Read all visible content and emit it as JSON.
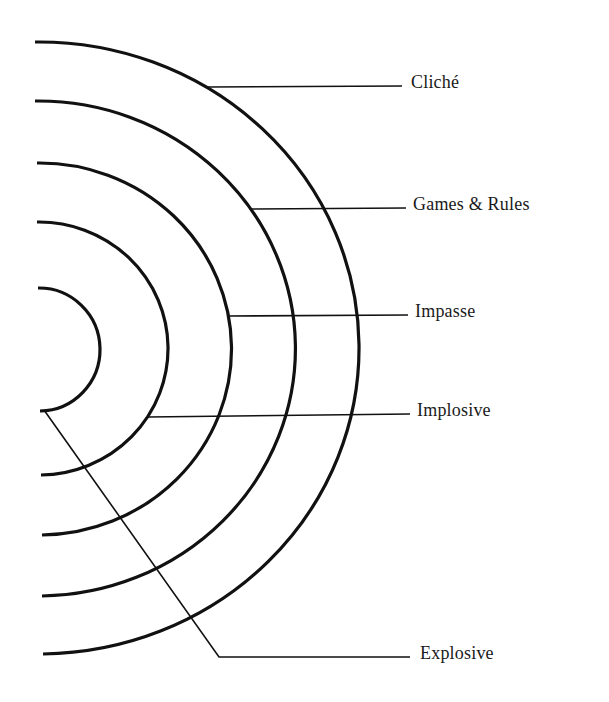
{
  "diagram": {
    "type": "concentric-half-ellipses-with-leader-labels",
    "stroke_color": "#111111",
    "background": "#ffffff",
    "arcs": [
      {
        "name": "innermost-arc",
        "top": [
          38,
          288
        ],
        "bottom": [
          40,
          411
        ],
        "rx": 61,
        "ry": 61.5
      },
      {
        "name": "second-arc",
        "top": [
          37,
          222
        ],
        "bottom": [
          41,
          475
        ],
        "rx": 129,
        "ry": 126.5
      },
      {
        "name": "third-arc",
        "top": [
          37,
          163
        ],
        "bottom": [
          42,
          535
        ],
        "rx": 192,
        "ry": 186
      },
      {
        "name": "fourth-arc",
        "top": [
          35,
          101
        ],
        "bottom": [
          42,
          596
        ],
        "rx": 257,
        "ry": 247.5
      },
      {
        "name": "outermost-arc",
        "top": [
          35,
          42
        ],
        "bottom": [
          43,
          654
        ],
        "rx": 320,
        "ry": 306
      }
    ],
    "labels": [
      {
        "text": "Cliché",
        "leader": [
          [
            208,
            87
          ],
          [
            402,
            86
          ]
        ],
        "x": 411,
        "y": 73
      },
      {
        "text": "Games & Rules",
        "leader": [
          [
            252,
            209
          ],
          [
            406,
            208
          ]
        ],
        "x": 413,
        "y": 195
      },
      {
        "text": "Impasse",
        "leader": [
          [
            228,
            316
          ],
          [
            408,
            315
          ]
        ],
        "x": 415,
        "y": 302
      },
      {
        "text": "Implosive",
        "leader": [
          [
            148,
            417
          ],
          [
            410,
            414
          ]
        ],
        "x": 417,
        "y": 401
      },
      {
        "text": "Explosive",
        "leader": [
          [
            44,
            410
          ],
          [
            219,
            657
          ],
          [
            410,
            657
          ]
        ],
        "x": 420,
        "y": 644
      }
    ]
  }
}
